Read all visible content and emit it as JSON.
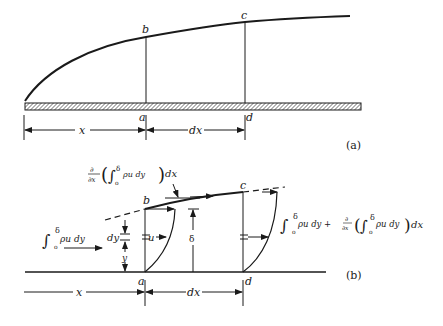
{
  "figure_a": {
    "caption": "(a)",
    "points": {
      "a": "a",
      "b": "b",
      "c": "c",
      "d": "d"
    },
    "dims": {
      "x": "x",
      "dx": "dx"
    }
  },
  "figure_b": {
    "caption": "(b)",
    "points": {
      "a": "a",
      "b": "b",
      "c": "c",
      "d": "d"
    },
    "dims": {
      "x": "x",
      "dx": "dx",
      "delta": "δ",
      "dy": "dy",
      "y": "y",
      "u": "u"
    },
    "inflow": {
      "int": "∫",
      "upper": "δ",
      "lower": "o",
      "body": "ρu dy"
    },
    "top_flux": {
      "d": "∂",
      "dx_den": "∂x",
      "open": "(",
      "int": "∫",
      "upper": "δ",
      "lower": "o",
      "body": "ρu dy",
      "close": ")",
      "tail": "dx"
    },
    "outflow": {
      "int1": "∫",
      "upper1": "δ",
      "lower1": "o",
      "body1": "ρu dy +",
      "d": "∂",
      "dx_den": "∂x",
      "open": "(",
      "int2": "∫",
      "upper2": "δ",
      "lower2": "o",
      "body2": "ρu dy",
      "close": ")",
      "tail": "dx"
    }
  },
  "colors": {
    "ink": "#1a1a1a",
    "background": "#ffffff"
  }
}
